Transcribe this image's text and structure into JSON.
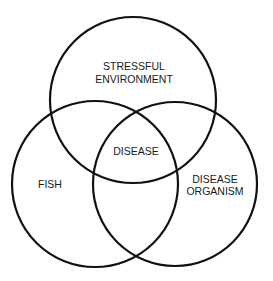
{
  "diagram": {
    "type": "venn",
    "colors": {
      "stroke": "#111111",
      "text": "#1a1a1a",
      "background": "#ffffff"
    },
    "circles": [
      {
        "id": "stressful-environment",
        "label_lines": [
          "STRESSFUL",
          "ENVIRONMENT"
        ]
      },
      {
        "id": "fish",
        "label_lines": [
          "FISH"
        ]
      },
      {
        "id": "disease-organism",
        "label_lines": [
          "DISEASE",
          "ORGANISM"
        ]
      }
    ],
    "intersection": {
      "label": "DISEASE"
    }
  }
}
